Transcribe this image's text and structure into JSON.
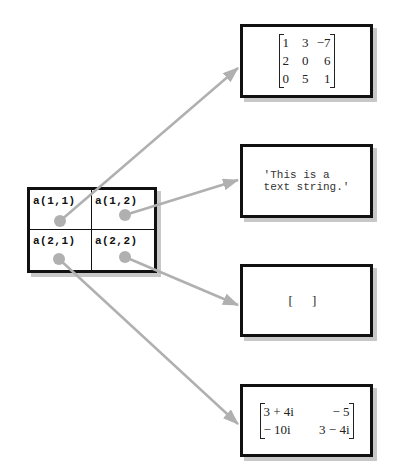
{
  "cell_array": {
    "cells": [
      {
        "label": "a(1,1)"
      },
      {
        "label": "a(1,2)"
      },
      {
        "label": "a(2,1)"
      },
      {
        "label": "a(2,2)"
      }
    ]
  },
  "targets": {
    "matrix_real": {
      "rows": [
        [
          "1",
          "3",
          "−7"
        ],
        [
          "2",
          "0",
          "6"
        ],
        [
          "0",
          "5",
          "1"
        ]
      ]
    },
    "text_string": {
      "line1": "'This is a",
      "line2": "text string.'"
    },
    "empty_array": {
      "text": "[ ]"
    },
    "matrix_complex": {
      "rows": [
        [
          "3 + 4i",
          "− 5"
        ],
        [
          "− 10i",
          "3 − 4i"
        ]
      ]
    }
  },
  "colors": {
    "arrow": "#b0b0b0",
    "border": "#111111",
    "shadow": "#c8c8c8"
  }
}
